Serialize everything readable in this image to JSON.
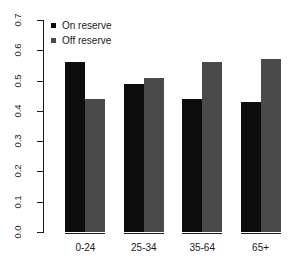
{
  "chart_data": {
    "type": "bar",
    "title": "",
    "subtitle": "",
    "xlabel": "",
    "ylabel": "",
    "categories": [
      "0-24",
      "25-34",
      "35-64",
      "65+"
    ],
    "series": [
      {
        "name": "On reserve",
        "color": "#0d0d0d",
        "values": [
          0.56,
          0.49,
          0.44,
          0.43
        ]
      },
      {
        "name": "Off reserve",
        "color": "#4a4a4a",
        "values": [
          0.44,
          0.51,
          0.56,
          0.57
        ]
      }
    ],
    "ylim": [
      0.0,
      0.7
    ],
    "ytick_labels": [
      "0.0",
      "0.1",
      "0.2",
      "0.3",
      "0.4",
      "0.5",
      "0.6",
      "0.7"
    ],
    "ytick_values": [
      0.0,
      0.1,
      0.2,
      0.3,
      0.4,
      0.5,
      0.6,
      0.7
    ],
    "grid": false,
    "legend_position": "top-left",
    "legend": [
      "On reserve",
      "Off reserve"
    ],
    "background": "#ffffff",
    "axis_color": "#1a1a1a"
  }
}
